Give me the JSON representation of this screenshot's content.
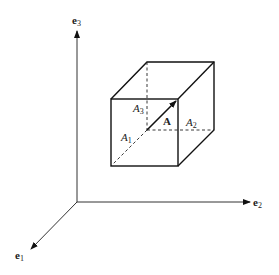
{
  "diagram": {
    "axes": {
      "e1": {
        "name": "e",
        "sub": "1"
      },
      "e2": {
        "name": "e",
        "sub": "2"
      },
      "e3": {
        "name": "e",
        "sub": "3"
      }
    },
    "vector": {
      "label": "A"
    },
    "components": [
      {
        "name": "A",
        "sub": "1"
      },
      {
        "name": "A",
        "sub": "2"
      },
      {
        "name": "A",
        "sub": "3"
      }
    ]
  }
}
